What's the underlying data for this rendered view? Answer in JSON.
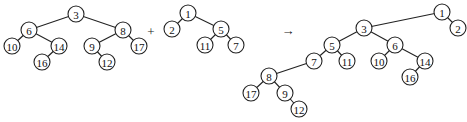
{
  "diagram": {
    "operators": {
      "plus": "+",
      "arrow": "→"
    },
    "node_radius": 8,
    "trees": [
      {
        "id": "left-heap",
        "nodes": [
          {
            "id": "a3",
            "label": "3",
            "x": 76,
            "y": 14
          },
          {
            "id": "a6",
            "label": "6",
            "x": 29,
            "y": 30
          },
          {
            "id": "a8",
            "label": "8",
            "x": 123,
            "y": 30
          },
          {
            "id": "a10",
            "label": "10",
            "x": 12,
            "y": 46
          },
          {
            "id": "a14",
            "label": "14",
            "x": 59,
            "y": 46
          },
          {
            "id": "a9",
            "label": "9",
            "x": 92,
            "y": 46
          },
          {
            "id": "a17",
            "label": "17",
            "x": 139,
            "y": 46
          },
          {
            "id": "a16",
            "label": "16",
            "x": 42,
            "y": 62
          },
          {
            "id": "a12",
            "label": "12",
            "x": 107,
            "y": 62
          }
        ],
        "edges": [
          [
            "a3",
            "a6"
          ],
          [
            "a3",
            "a8"
          ],
          [
            "a6",
            "a10"
          ],
          [
            "a6",
            "a14"
          ],
          [
            "a14",
            "a16"
          ],
          [
            "a8",
            "a9"
          ],
          [
            "a8",
            "a17"
          ],
          [
            "a9",
            "a12"
          ]
        ]
      },
      {
        "id": "right-heap",
        "nodes": [
          {
            "id": "b1",
            "label": "1",
            "x": 188,
            "y": 13
          },
          {
            "id": "b2",
            "label": "2",
            "x": 172,
            "y": 29
          },
          {
            "id": "b5",
            "label": "5",
            "x": 221,
            "y": 29
          },
          {
            "id": "b11",
            "label": "11",
            "x": 205,
            "y": 45
          },
          {
            "id": "b7",
            "label": "7",
            "x": 236,
            "y": 45
          }
        ],
        "edges": [
          [
            "b1",
            "b2"
          ],
          [
            "b1",
            "b5"
          ],
          [
            "b5",
            "b11"
          ],
          [
            "b5",
            "b7"
          ]
        ]
      },
      {
        "id": "merged-heap",
        "nodes": [
          {
            "id": "c1",
            "label": "1",
            "x": 442,
            "y": 12
          },
          {
            "id": "c2",
            "label": "2",
            "x": 458,
            "y": 28
          },
          {
            "id": "c3",
            "label": "3",
            "x": 364,
            "y": 28
          },
          {
            "id": "c5",
            "label": "5",
            "x": 332,
            "y": 45
          },
          {
            "id": "c6",
            "label": "6",
            "x": 395,
            "y": 45
          },
          {
            "id": "c7",
            "label": "7",
            "x": 314,
            "y": 61
          },
          {
            "id": "c11",
            "label": "11",
            "x": 347,
            "y": 61
          },
          {
            "id": "c10",
            "label": "10",
            "x": 379,
            "y": 61
          },
          {
            "id": "c14",
            "label": "14",
            "x": 425,
            "y": 61
          },
          {
            "id": "c16",
            "label": "16",
            "x": 410,
            "y": 77
          },
          {
            "id": "c8",
            "label": "8",
            "x": 269,
            "y": 76
          },
          {
            "id": "c17",
            "label": "17",
            "x": 251,
            "y": 93
          },
          {
            "id": "c9",
            "label": "9",
            "x": 285,
            "y": 93
          },
          {
            "id": "c12",
            "label": "12",
            "x": 299,
            "y": 109
          }
        ],
        "edges": [
          [
            "c1",
            "c3"
          ],
          [
            "c1",
            "c2"
          ],
          [
            "c3",
            "c5"
          ],
          [
            "c3",
            "c6"
          ],
          [
            "c5",
            "c7"
          ],
          [
            "c5",
            "c11"
          ],
          [
            "c6",
            "c10"
          ],
          [
            "c6",
            "c14"
          ],
          [
            "c14",
            "c16"
          ],
          [
            "c7",
            "c8"
          ],
          [
            "c8",
            "c17"
          ],
          [
            "c8",
            "c9"
          ],
          [
            "c9",
            "c12"
          ]
        ]
      }
    ],
    "operator_positions": {
      "plus": {
        "x": 151,
        "y": 31
      },
      "arrow": {
        "x": 288,
        "y": 30
      }
    }
  }
}
